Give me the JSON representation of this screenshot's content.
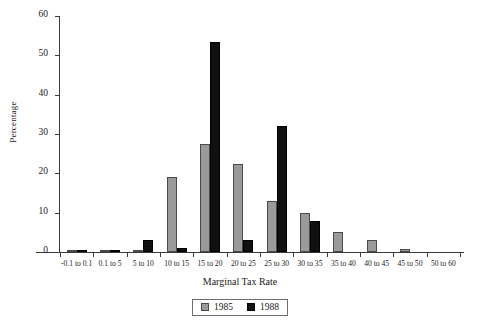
{
  "chart_data": {
    "type": "bar",
    "title": "",
    "xlabel": "Marginal Tax Rate",
    "ylabel": "Percentage",
    "ylim": [
      0,
      60
    ],
    "yticks": [
      0,
      10,
      20,
      30,
      40,
      50,
      60
    ],
    "grid": false,
    "legend_position": "bottom-center",
    "categories": [
      "-0.1 to 0.1",
      "0.1 to 5",
      "5 to 10",
      "10 to 15",
      "15 to 20",
      "20 to 25",
      "25 to 30",
      "30 to 35",
      "35 to 40",
      "40 to 45",
      "45 to 50",
      "50 to 60"
    ],
    "series": [
      {
        "name": "1985",
        "color": "#9a9a9a",
        "values": [
          0.3,
          0.4,
          0.4,
          19.0,
          27.5,
          22.5,
          13.0,
          10.0,
          5.0,
          3.0,
          0.7,
          0.0
        ]
      },
      {
        "name": "1988",
        "color": "#101010",
        "values": [
          0.2,
          0.2,
          3.0,
          1.0,
          53.5,
          3.0,
          32.0,
          8.0,
          0.0,
          0.0,
          0.0,
          0.0
        ]
      }
    ]
  }
}
